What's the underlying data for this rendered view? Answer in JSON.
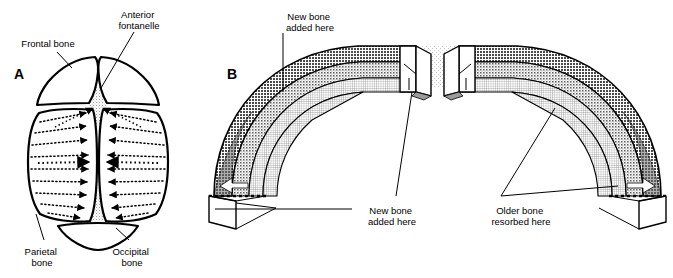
{
  "figure": {
    "background_color": "#ffffff",
    "width": 673,
    "height": 278
  },
  "panels": [
    {
      "id": "A",
      "letter": "A",
      "caption": "Superior view of infant skull showing fontanelles and bone growth direction",
      "labels": [
        {
          "name": "frontal-bone",
          "text_lines": [
            "Frontal bone"
          ],
          "x": 48,
          "y": 44
        },
        {
          "name": "anterior-fontanelle",
          "text_lines": [
            "Anterior",
            "fontanelle"
          ],
          "x": 139,
          "y": 15
        },
        {
          "name": "parietal-bone",
          "text_lines": [
            "Parietal",
            "bone"
          ],
          "x": 42,
          "y": 252
        },
        {
          "name": "occipital-bone",
          "text_lines": [
            "Occipital",
            "bone"
          ],
          "x": 132,
          "y": 252
        }
      ]
    },
    {
      "id": "B",
      "letter": "B",
      "caption": "Cross-section of cranial vault showing appositional growth and resorption",
      "labels": [
        {
          "name": "new-bone-added-here-top",
          "text_lines": [
            "New bone",
            "added here"
          ],
          "x": 310,
          "y": 17
        },
        {
          "name": "new-bone-added-here-bottom",
          "text_lines": [
            "New bone",
            "added here"
          ],
          "x": 392,
          "y": 211
        },
        {
          "name": "older-bone-resorbed-here",
          "text_lines": [
            "Older bone",
            "resorbed here"
          ],
          "x": 521,
          "y": 211
        }
      ]
    }
  ],
  "colors": {
    "outline": "#000000",
    "background": "#ffffff",
    "outer_band_dark": "#8a8a8a",
    "middle_band_medium": "#b8b8b8",
    "inner_band_light": "#d8d8d8",
    "fontanelle_fill": "#dcdcdc",
    "suture_fill": "#dededc",
    "arrow_fill": "#000000",
    "white_arrow_fill": "#ffffff"
  },
  "legend_meanings": {
    "dark_band": "Outer table - new bone added on outer surface",
    "light_band": "Inner table - older bone resorbed on inner surface",
    "black_arrows": "Direction of bone growth at sutures",
    "white_arrows": "Direction of outward expansion of the cranial vault",
    "dotted_line": "Original position of the skull base reference plane"
  }
}
